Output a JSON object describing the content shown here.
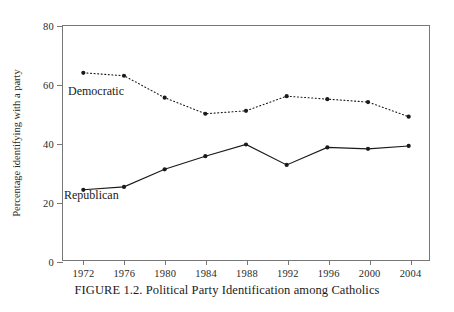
{
  "chart_data": {
    "type": "line",
    "title": "",
    "caption": "FIGURE 1.2.  Political Party Identification among Catholics",
    "xlabel": "",
    "ylabel": "Percentage identifying with a party",
    "x": [
      1972,
      1976,
      1980,
      1984,
      1988,
      1992,
      1996,
      2000,
      2004
    ],
    "xticklabels": [
      "1972",
      "1976",
      "1980",
      "1984",
      "1988",
      "1992",
      "1996",
      "2000",
      "2004"
    ],
    "yticks": [
      0,
      20,
      40,
      60,
      80
    ],
    "yticklabels": [
      "0",
      "20",
      "40",
      "60",
      "80"
    ],
    "ylim": [
      0,
      80
    ],
    "xlim": [
      1970,
      2006
    ],
    "grid": false,
    "legend": "inline-annotations",
    "series": [
      {
        "name": "Democratic",
        "style": "dotted",
        "color": "#1a1a1a",
        "marker": "circle",
        "values": [
          64,
          63,
          55.5,
          50,
          51,
          56,
          55,
          54,
          49
        ]
      },
      {
        "name": "Republican",
        "style": "solid",
        "color": "#1a1a1a",
        "marker": "circle",
        "values": [
          24,
          25,
          31,
          35.5,
          39.5,
          32.5,
          38.5,
          38,
          39
        ]
      }
    ],
    "annotations": [
      {
        "text": "Democratic",
        "series": "Democratic"
      },
      {
        "text": "Republican",
        "series": "Republican"
      }
    ]
  }
}
